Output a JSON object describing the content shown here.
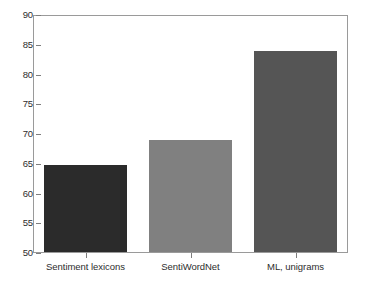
{
  "chart_data": {
    "type": "bar",
    "title": "",
    "subtitle": "",
    "xlabel": "",
    "ylabel": "",
    "categories": [
      "Sentiment lexicons",
      "SentiWordNet",
      "ML, unigrams"
    ],
    "values": [
      64.7,
      68.8,
      83.8
    ],
    "series": [
      {
        "name": "Accuracy",
        "values": [
          64.7,
          68.8,
          83.8
        ]
      }
    ],
    "bar_colors": [
      "#2b2b2b",
      "#808080",
      "#555555"
    ],
    "ylim": [
      50,
      90
    ],
    "yticks": [
      50,
      55,
      60,
      65,
      70,
      75,
      80,
      85,
      90
    ],
    "ytick_labels": [
      "50",
      "55",
      "60",
      "65",
      "70",
      "75",
      "80",
      "85",
      "90"
    ],
    "grid": false,
    "legend": false,
    "legend_position": "none",
    "annotations": [],
    "frame_color": "#9a9a9a",
    "background_color": "#ffffff",
    "text_color": "#2d2d2d"
  }
}
